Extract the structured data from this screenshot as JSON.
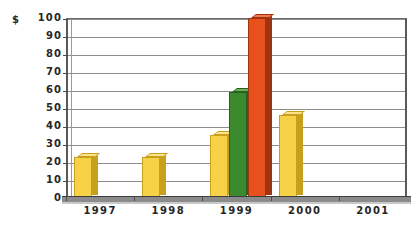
{
  "chart_data": {
    "type": "bar",
    "title": "",
    "subtitle": "",
    "xlabel": "",
    "ylabel": "$",
    "currency_symbol": "$",
    "categories": [
      "1997",
      "1998",
      "1999",
      "2000",
      "2001"
    ],
    "ylim": [
      0,
      100
    ],
    "y_ticks": [
      0,
      10,
      20,
      30,
      40,
      50,
      60,
      70,
      80,
      90,
      100
    ],
    "y_tick_labels": [
      "0",
      "10",
      "20",
      "30",
      "40",
      "50",
      "60",
      "70",
      "80",
      "90",
      "100"
    ],
    "grid": true,
    "legend": "none",
    "style": "3d-bars",
    "series": [
      {
        "name": "series-1",
        "color": "#F7D247",
        "side_color": "#C9A01E",
        "top_color": "#FAE38B",
        "values": [
          23,
          23,
          35,
          46,
          null
        ]
      },
      {
        "name": "series-2",
        "color": "#3C8A2E",
        "side_color": "#2A6120",
        "top_color": "#6BAE58",
        "values": [
          null,
          null,
          59,
          null,
          null
        ]
      },
      {
        "name": "series-3",
        "color": "#E8511B",
        "side_color": "#9E3411",
        "top_color": "#F07A4D",
        "values": [
          null,
          null,
          100,
          null,
          null
        ]
      }
    ],
    "bars": [
      {
        "category": "1997",
        "series": "series-1",
        "value": 23,
        "color": "#F7D247",
        "side_color": "#C9A01E",
        "top_color": "#FAE38B"
      },
      {
        "category": "1998",
        "series": "series-1",
        "value": 23,
        "color": "#F7D247",
        "side_color": "#C9A01E",
        "top_color": "#FAE38B"
      },
      {
        "category": "1999",
        "series": "series-1",
        "value": 35,
        "color": "#F7D247",
        "side_color": "#C9A01E",
        "top_color": "#FAE38B"
      },
      {
        "category": "1999",
        "series": "series-2",
        "value": 59,
        "color": "#3C8A2E",
        "side_color": "#2A6120",
        "top_color": "#6BAE58"
      },
      {
        "category": "1999",
        "series": "series-3",
        "value": 100,
        "color": "#E8511B",
        "side_color": "#9E3411",
        "top_color": "#F07A4D"
      },
      {
        "category": "2000",
        "series": "series-1",
        "value": 46,
        "color": "#F7D247",
        "side_color": "#C9A01E",
        "top_color": "#FAE38B"
      }
    ],
    "colors": {
      "background": "#FFFFFF",
      "gridline": "#8D8D8D",
      "axis": "#5A5A5A",
      "floor": "#8B8B8B",
      "text": "#262626"
    }
  }
}
